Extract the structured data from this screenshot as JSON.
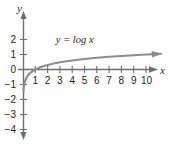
{
  "chart_data": {
    "type": "line",
    "title": "",
    "subtitle": "",
    "xlabel": "x",
    "ylabel": "y",
    "xlim": [
      -0.4,
      11.6
    ],
    "ylim": [
      -4.6,
      2.6
    ],
    "grid": false,
    "legend_position": "none",
    "annotations": [
      {
        "name": "curve-equation",
        "text": "y = log x",
        "x": 4.2,
        "y": 1.75
      }
    ],
    "xticks": [
      1,
      2,
      3,
      4,
      5,
      6,
      7,
      8,
      9,
      10
    ],
    "xtick_labels": [
      "1",
      "2",
      "3",
      "4",
      "5",
      "6",
      "7",
      "8",
      "9",
      "10"
    ],
    "yticks": [
      2,
      1,
      0,
      -1,
      -2,
      -3,
      -4
    ],
    "ytick_labels": [
      "2",
      "1",
      "0",
      "−1",
      "−2",
      "−3",
      "−4"
    ],
    "series": [
      {
        "name": "y = log x",
        "equation": "y = log x",
        "color": "#8c8c8c",
        "x": [
          0.035,
          0.05,
          0.08,
          0.12,
          0.2,
          0.3,
          0.4,
          0.5,
          0.7,
          1.0,
          1.5,
          2.0,
          2.5,
          3.0,
          4.0,
          5.0,
          6.0,
          7.0,
          8.0,
          9.0,
          10.0,
          11.2
        ],
        "y": [
          -1.46,
          -1.3,
          -1.1,
          -0.92,
          -0.7,
          -0.52,
          -0.4,
          -0.3,
          -0.15,
          0.0,
          0.18,
          0.3,
          0.4,
          0.48,
          0.6,
          0.7,
          0.78,
          0.85,
          0.9,
          0.95,
          1.0,
          1.05
        ]
      }
    ]
  },
  "axes": {
    "x_axis_name": "x",
    "y_axis_name": "y",
    "x_arrow": "arrow-right",
    "y_arrow_up": "arrow-up",
    "y_arrow_down": "arrow-down",
    "curve_arrow": "arrow-right"
  },
  "colors": {
    "background": "#ffffff",
    "axis": "#6d6e71",
    "curve": "#8c8c8c",
    "text": "#231f20"
  }
}
